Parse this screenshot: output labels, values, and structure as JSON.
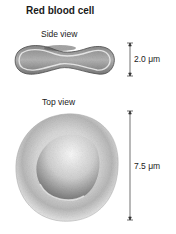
{
  "title": "Red blood cell",
  "side_view": {
    "label": "Side view",
    "scale_label": "2.0 μm",
    "scale_value": 2.0,
    "scale_unit": "μm"
  },
  "top_view": {
    "label": "Top view",
    "scale_label": "7.5 μm",
    "scale_value": 7.5,
    "scale_unit": "μm"
  },
  "colors": {
    "cell_dark": "#5a5a5a",
    "cell_mid": "#9a9a9a",
    "cell_light": "#e8e8e8",
    "line": "#333333"
  }
}
